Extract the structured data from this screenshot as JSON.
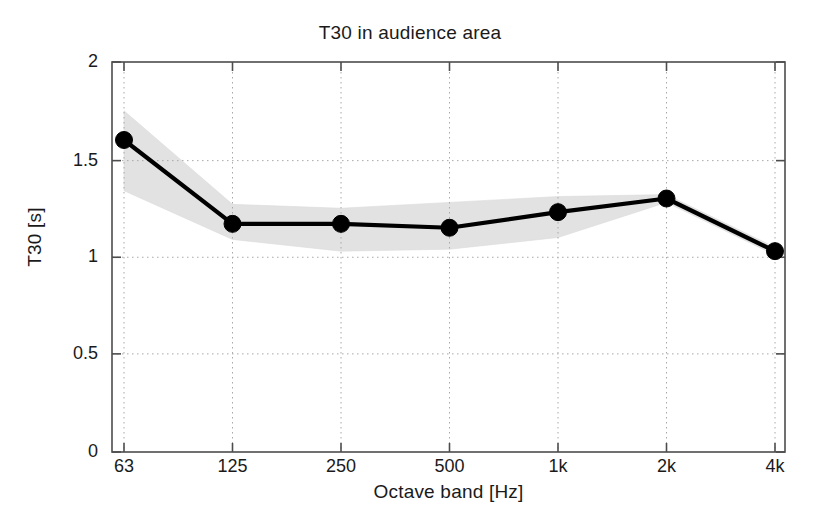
{
  "chart_data": {
    "type": "line",
    "title": "T30 in audience area",
    "xlabel": "Octave band [Hz]",
    "ylabel": "T30 [s]",
    "categories": [
      "63",
      "125",
      "250",
      "500",
      "1k",
      "2k",
      "4k"
    ],
    "xtick_labels": [
      "63",
      "125",
      "250",
      "500",
      "1k",
      "2k",
      "4k"
    ],
    "ytick_labels": [
      "0",
      "0.5",
      "1",
      "1.5",
      "2"
    ],
    "ytick_values": [
      0,
      0.5,
      1,
      1.5,
      2
    ],
    "ylim": [
      0,
      2
    ],
    "grid": "dotted-both",
    "legend": "none",
    "series": [
      {
        "name": "T30 mean",
        "marker": "filled-circle",
        "color": "#000000",
        "values": [
          1.6,
          1.17,
          1.17,
          1.15,
          1.23,
          1.3,
          1.03
        ]
      }
    ],
    "band": {
      "name": "spatial spread",
      "color": "#e2e2e2",
      "upper": [
        1.75,
        1.27,
        1.25,
        1.28,
        1.31,
        1.32,
        1.05
      ],
      "lower": [
        1.34,
        1.09,
        1.03,
        1.04,
        1.1,
        1.28,
        1.01
      ]
    },
    "annotations": []
  },
  "figure": {
    "background_color": "#ffffff",
    "axis_color": "#4d4d4d",
    "grid_color": "#b9b9b9"
  }
}
